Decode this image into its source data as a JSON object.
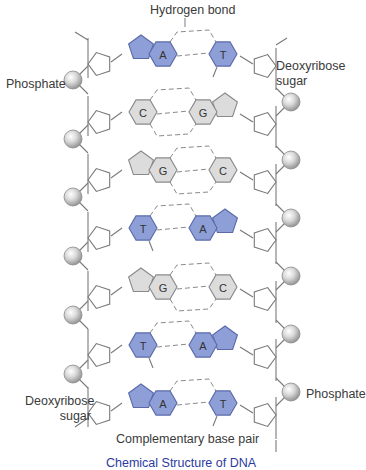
{
  "labels": {
    "hydrogen_bond": "Hydrogen bond",
    "phosphate_top": "Phosphate",
    "deoxyribose_top": [
      "Deoxyribose",
      "sugar"
    ],
    "deoxyribose_bottom": [
      "Deoxyribose",
      "sugar"
    ],
    "phosphate_bottom": "Phosphate",
    "complementary_base_pair": "Complementary base pair"
  },
  "caption": "Chemical Structure of DNA",
  "colors": {
    "purine_pyrimidine_AT": "#8e9fd8",
    "AT_stroke": "#5a6aa8",
    "CG_fill": "#dcdcdc",
    "CG_stroke": "#8a8a8a",
    "backbone": "#7a7a7a",
    "hbond": "#8a8a8a"
  },
  "base_pairs": [
    {
      "left": "A",
      "right": "T",
      "type": "AT",
      "left_is_purine": true
    },
    {
      "left": "C",
      "right": "G",
      "type": "CG",
      "left_is_purine": false
    },
    {
      "left": "G",
      "right": "C",
      "type": "CG",
      "left_is_purine": true
    },
    {
      "left": "T",
      "right": "A",
      "type": "AT",
      "left_is_purine": false
    },
    {
      "left": "G",
      "right": "C",
      "type": "CG",
      "left_is_purine": true
    },
    {
      "left": "T",
      "right": "A",
      "type": "AT",
      "left_is_purine": false
    },
    {
      "left": "A",
      "right": "T",
      "type": "AT",
      "left_is_purine": true
    }
  ]
}
